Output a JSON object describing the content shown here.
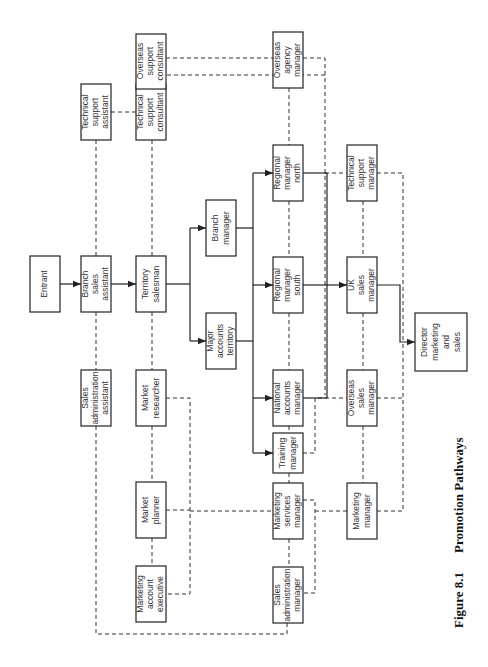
{
  "figure": {
    "number": "Figure 8.1",
    "title": "Promotion Pathways"
  },
  "colors": {
    "line": "#222222",
    "text": "#333333",
    "background": "#ffffff"
  },
  "legend_implied": {
    "solid_arrow": "direct promotion path",
    "dashed_line": "lateral / alternative move"
  },
  "nodes": [
    {
      "id": "entrant",
      "lines": [
        "Entrant"
      ]
    },
    {
      "id": "branch-sales-assistant",
      "lines": [
        "Branch",
        "sales",
        "assistant"
      ]
    },
    {
      "id": "territory-salesman",
      "lines": [
        "Territory",
        "salesman"
      ]
    },
    {
      "id": "technical-support-assistant",
      "lines": [
        "Technical",
        "support",
        "assistant"
      ]
    },
    {
      "id": "technical-support-consultant",
      "lines": [
        "Technical",
        "support",
        "consultant"
      ]
    },
    {
      "id": "overseas-support-consultant",
      "lines": [
        "Overseas",
        "support",
        "consultant"
      ]
    },
    {
      "id": "sales-administration-assistant",
      "lines": [
        "Sales",
        "administration",
        "assistant"
      ]
    },
    {
      "id": "market-researcher",
      "lines": [
        "Market",
        "researcher"
      ]
    },
    {
      "id": "market-planner",
      "lines": [
        "Market",
        "planner"
      ]
    },
    {
      "id": "marketing-account-executive",
      "lines": [
        "Marketing",
        "account",
        "executive"
      ]
    },
    {
      "id": "branch-manager",
      "lines": [
        "Branch",
        "manager"
      ]
    },
    {
      "id": "major-accounts-territory",
      "lines": [
        "Major",
        "accounts",
        "territory"
      ]
    },
    {
      "id": "overseas-agency-manager",
      "lines": [
        "Overseas",
        "agency",
        "manager"
      ]
    },
    {
      "id": "regional-manager-north",
      "lines": [
        "Regional",
        "manager",
        "north"
      ]
    },
    {
      "id": "regional-manager-south",
      "lines": [
        "Regional",
        "manager",
        "south"
      ]
    },
    {
      "id": "national-accounts-manager",
      "lines": [
        "National",
        "accounts",
        "manager"
      ]
    },
    {
      "id": "training-manager",
      "lines": [
        "Training",
        "manager"
      ]
    },
    {
      "id": "marketing-services-manager",
      "lines": [
        "Marketing",
        "services",
        "manager"
      ]
    },
    {
      "id": "sales-administration-manager",
      "lines": [
        "Sales",
        "administration",
        "manager"
      ]
    },
    {
      "id": "technical-support-manager",
      "lines": [
        "Technical",
        "support",
        "manager"
      ]
    },
    {
      "id": "uk-sales-manager",
      "lines": [
        "UK",
        "sales",
        "manager"
      ]
    },
    {
      "id": "overseas-sales-manager",
      "lines": [
        "Overseas",
        "sales",
        "manager"
      ]
    },
    {
      "id": "marketing-manager",
      "lines": [
        "Marketing",
        "manager"
      ]
    },
    {
      "id": "director-marketing-and-sales",
      "lines": [
        "Director",
        "marketing",
        "and",
        "sales"
      ]
    }
  ],
  "edges_solid": [
    [
      "entrant",
      "branch-sales-assistant"
    ],
    [
      "branch-sales-assistant",
      "territory-salesman"
    ],
    [
      "territory-salesman",
      "branch-manager"
    ],
    [
      "territory-salesman",
      "major-accounts-territory"
    ],
    [
      "branch-manager",
      "regional-manager-north"
    ],
    [
      "branch-manager",
      "regional-manager-south"
    ],
    [
      "major-accounts-territory",
      "national-accounts-manager"
    ],
    [
      "major-accounts-territory",
      "training-manager"
    ],
    [
      "regional-manager-north",
      "uk-sales-manager"
    ],
    [
      "regional-manager-south",
      "uk-sales-manager"
    ],
    [
      "national-accounts-manager",
      "uk-sales-manager"
    ],
    [
      "uk-sales-manager",
      "director-marketing-and-sales"
    ]
  ],
  "edges_dashed": [
    [
      "technical-support-assistant",
      "branch-sales-assistant"
    ],
    [
      "technical-support-assistant",
      "technical-support-consultant"
    ],
    [
      "overseas-support-consultant",
      "technical-support-consultant"
    ],
    [
      "overseas-support-consultant",
      "overseas-agency-manager"
    ],
    [
      "technical-support-consultant",
      "territory-salesman"
    ],
    [
      "technical-support-consultant",
      "technical-support-manager"
    ],
    [
      "overseas-agency-manager",
      "regional-manager-north"
    ],
    [
      "overseas-agency-manager",
      "director-marketing-and-sales"
    ],
    [
      "branch-sales-assistant",
      "sales-administration-assistant"
    ],
    [
      "sales-administration-assistant",
      "sales-administration-manager"
    ],
    [
      "territory-salesman",
      "market-researcher"
    ],
    [
      "market-researcher",
      "market-planner"
    ],
    [
      "market-planner",
      "marketing-account-executive"
    ],
    [
      "market-researcher",
      "marketing-services-manager"
    ],
    [
      "market-planner",
      "marketing-services-manager"
    ],
    [
      "marketing-account-executive",
      "marketing-services-manager"
    ],
    [
      "regional-manager-north",
      "regional-manager-south"
    ],
    [
      "regional-manager-south",
      "national-accounts-manager"
    ],
    [
      "national-accounts-manager",
      "training-manager"
    ],
    [
      "training-manager",
      "marketing-services-manager"
    ],
    [
      "marketing-services-manager",
      "sales-administration-manager"
    ],
    [
      "regional-manager-north",
      "technical-support-manager"
    ],
    [
      "technical-support-manager",
      "uk-sales-manager"
    ],
    [
      "uk-sales-manager",
      "overseas-sales-manager"
    ],
    [
      "overseas-sales-manager",
      "marketing-manager"
    ],
    [
      "training-manager",
      "overseas-sales-manager"
    ],
    [
      "marketing-services-manager",
      "marketing-manager"
    ],
    [
      "sales-administration-manager",
      "marketing-manager"
    ],
    [
      "overseas-sales-manager",
      "director-marketing-and-sales"
    ],
    [
      "marketing-manager",
      "director-marketing-and-sales"
    ],
    [
      "technical-support-manager",
      "director-marketing-and-sales"
    ]
  ]
}
